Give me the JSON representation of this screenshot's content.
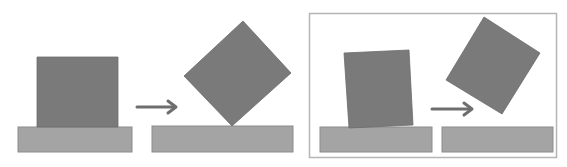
{
  "diagram": {
    "colors": {
      "background": "#ffffff",
      "block": "#7a7a7a",
      "block_edge": "#6c6c6c",
      "ground": "#a4a4a4",
      "ground_edge": "#8c8c8c",
      "arrow": "#6e6e6e",
      "frame": "#b5b5b5"
    },
    "panels": [
      {
        "id": "left-pair",
        "framed": false,
        "steps": [
          {
            "label": "upright block on ground",
            "block": [
              [
                37,
                57
              ],
              [
                118,
                57
              ],
              [
                118,
                127
              ],
              [
                37,
                127
              ]
            ],
            "ground": {
              "x": 18,
              "y": 127,
              "w": 114,
              "h": 25
            }
          },
          {
            "label": "block balanced on corner",
            "block": [
              [
                243,
                21
              ],
              [
                291,
                73
              ],
              [
                232,
                126
              ],
              [
                184,
                76
              ]
            ],
            "ground": {
              "x": 152,
              "y": 126,
              "w": 141,
              "h": 26
            }
          }
        ],
        "arrow": {
          "x1": 137,
          "y1": 107,
          "x2": 176,
          "y2": 107
        }
      },
      {
        "id": "right-pair",
        "framed": true,
        "frame": {
          "x": 309,
          "y": 13,
          "w": 247,
          "h": 144
        },
        "steps": [
          {
            "label": "slightly tilted block on ground",
            "block": [
              [
                344,
                53
              ],
              [
                409,
                50
              ],
              [
                413,
                125
              ],
              [
                349,
                128
              ]
            ],
            "ground": {
              "x": 320,
              "y": 127,
              "w": 112,
              "h": 25
            }
          },
          {
            "label": "block tipping in air",
            "block": [
              [
                484,
                17
              ],
              [
                540,
                53
              ],
              [
                502,
                114
              ],
              [
                446,
                80
              ]
            ],
            "ground": {
              "x": 442,
              "y": 127,
              "w": 111,
              "h": 25
            }
          }
        ],
        "arrow": {
          "x1": 432,
          "y1": 109,
          "x2": 472,
          "y2": 109
        }
      }
    ]
  }
}
